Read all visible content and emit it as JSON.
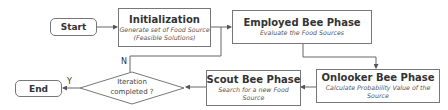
{
  "diagram": {
    "type": "flowchart",
    "nodes": {
      "start": {
        "label": "Start"
      },
      "initialization": {
        "title": "Initialization",
        "desc_line1": "Generate set of Food Source",
        "desc_line2": "(Feasible Solutions)"
      },
      "employed": {
        "title": "Employed Bee Phase",
        "desc_line1": "Evaluate the Food Sources"
      },
      "onlooker": {
        "title": "Onlooker Bee Phase",
        "desc_line1": "Calculate Probability Value of the",
        "desc_line2": "Source"
      },
      "scout": {
        "title": "Scout Bee Phase",
        "desc_line1": "Search for a new Food",
        "desc_line2": "Source"
      },
      "decision": {
        "line1": "Iteration",
        "line2": "completed ?"
      },
      "end": {
        "label": "End"
      }
    },
    "edge_labels": {
      "yes": "Y",
      "no": "N"
    },
    "edges": [
      {
        "from": "start",
        "to": "initialization"
      },
      {
        "from": "initialization",
        "to": "employed"
      },
      {
        "from": "employed",
        "to": "onlooker"
      },
      {
        "from": "onlooker",
        "to": "scout"
      },
      {
        "from": "scout",
        "to": "decision"
      },
      {
        "from": "decision",
        "to": "end",
        "label": "Y"
      },
      {
        "from": "decision",
        "to": "employed",
        "label": "N"
      }
    ],
    "colors": {
      "stroke": "#777777",
      "text": "#333333",
      "background": "#ffffff"
    }
  }
}
